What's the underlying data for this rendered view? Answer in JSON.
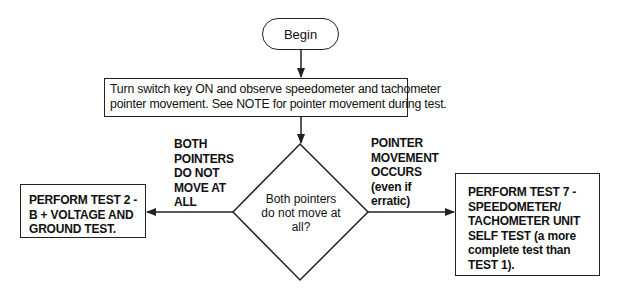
{
  "flowchart": {
    "start": {
      "label": "Begin"
    },
    "step1": {
      "lines": [
        "Turn switch key ON and observe speedometer and tachometer",
        "pointer movement. See NOTE for pointer movement during test."
      ]
    },
    "decision": {
      "lines": [
        "Both pointers",
        "do not move at",
        "all?"
      ]
    },
    "branch_left": {
      "condition_lines": [
        "BOTH",
        "POINTERS",
        "DO NOT",
        "MOVE AT",
        "ALL"
      ],
      "result_lines": [
        "PERFORM TEST 2 -",
        "B + VOLTAGE AND",
        "GROUND TEST."
      ]
    },
    "branch_right": {
      "condition_lines": [
        "POINTER",
        "MOVEMENT",
        "OCCURS",
        "(even if",
        "erratic)"
      ],
      "result_lines": [
        "PERFORM TEST 7 -",
        "SPEEDOMETER/",
        "TACHOMETER UNIT",
        "SELF TEST (a more",
        "complete test than",
        "TEST 1)."
      ]
    }
  },
  "colors": {
    "line": "#222222",
    "background": "#ffffff",
    "text": "#111111"
  }
}
